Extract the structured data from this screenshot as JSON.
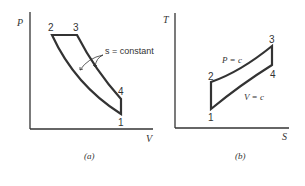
{
  "diagram_a": {
    "y_label": "P",
    "x_label": "V",
    "caption": "(a)",
    "points": [
      {
        "label": "1",
        "x": 121,
        "y": 114
      },
      {
        "label": "2",
        "x": 52,
        "y": 35
      },
      {
        "label": "3",
        "x": 77,
        "y": 35
      },
      {
        "label": "4",
        "x": 121,
        "y": 99
      }
    ],
    "annotation": "s = constant"
  },
  "diagram_b": {
    "y_label": "T",
    "x_label": "S",
    "caption": "(b)",
    "points": [
      {
        "label": "1",
        "x": 211,
        "y": 109
      },
      {
        "label": "2",
        "x": 211,
        "y": 82
      },
      {
        "label": "3",
        "x": 272,
        "y": 46
      },
      {
        "label": "4",
        "x": 272,
        "y": 65
      }
    ],
    "annotation_upper": "P = c",
    "annotation_lower": "V = c"
  }
}
